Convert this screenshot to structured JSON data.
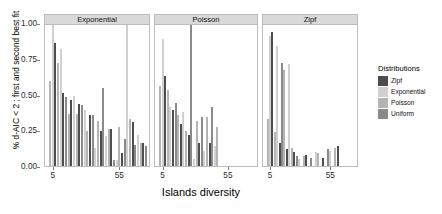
{
  "chart_data": {
    "type": "bar",
    "title": "",
    "xlabel": "Islands diversity",
    "ylabel": "% d-AIC < 2 ; first and second best fit",
    "ylim": [
      0,
      1
    ],
    "yticks": [
      "0.00",
      "0.25",
      "0.50",
      "0.75",
      "1.00"
    ],
    "ytickvals": [
      0,
      0.25,
      0.5,
      0.75,
      1
    ],
    "xticks": [
      "5",
      "55"
    ],
    "xtickvals": [
      5,
      55
    ],
    "grid": false,
    "legend_position": "right",
    "legend_title": "Distributions",
    "facet_variable": "best fit distribution",
    "facets": [
      "Exponential",
      "Poisson",
      "Zipf"
    ],
    "series": [
      {
        "name": "Zipf",
        "color": "#4d4d4d"
      },
      {
        "name": "Exponential",
        "color": "#d0d0d0"
      },
      {
        "name": "Poisson",
        "color": "#b4b4b4"
      },
      {
        "name": "Uniform",
        "color": "#8a8a8a"
      }
    ],
    "panels": [
      {
        "facet": "Exponential",
        "bars": [
          {
            "x": 3,
            "series": "Poisson",
            "value": 0.6
          },
          {
            "x": 5,
            "series": "Exponential",
            "value": 1.0
          },
          {
            "x": 7,
            "series": "Zipf",
            "value": 0.87
          },
          {
            "x": 9,
            "series": "Poisson",
            "value": 0.73
          },
          {
            "x": 11,
            "series": "Exponential",
            "value": 0.83
          },
          {
            "x": 13,
            "series": "Zipf",
            "value": 0.52
          },
          {
            "x": 15,
            "series": "Uniform",
            "value": 0.49
          },
          {
            "x": 17,
            "series": "Poisson",
            "value": 0.37
          },
          {
            "x": 19,
            "series": "Zipf",
            "value": 0.47
          },
          {
            "x": 21,
            "series": "Exponential",
            "value": 0.5
          },
          {
            "x": 23,
            "series": "Poisson",
            "value": 0.37
          },
          {
            "x": 25,
            "series": "Zipf",
            "value": 0.44
          },
          {
            "x": 27,
            "series": "Uniform",
            "value": 0.43
          },
          {
            "x": 29,
            "series": "Exponential",
            "value": 0.4
          },
          {
            "x": 31,
            "series": "Poisson",
            "value": 0.25
          },
          {
            "x": 33,
            "series": "Zipf",
            "value": 0.36
          },
          {
            "x": 35,
            "series": "Uniform",
            "value": 0.36
          },
          {
            "x": 37,
            "series": "Exponential",
            "value": 0.13
          },
          {
            "x": 39,
            "series": "Poisson",
            "value": 0.32
          },
          {
            "x": 41,
            "series": "Zipf",
            "value": 0.25
          },
          {
            "x": 43,
            "series": "Uniform",
            "value": 0.55
          },
          {
            "x": 45,
            "series": "Exponential",
            "value": 0.21
          },
          {
            "x": 47,
            "series": "Poisson",
            "value": 0.26
          },
          {
            "x": 49,
            "series": "Zipf",
            "value": 0.26
          },
          {
            "x": 51,
            "series": "Uniform",
            "value": 0.04
          },
          {
            "x": 53,
            "series": "Exponential",
            "value": 0.04
          },
          {
            "x": 55,
            "series": "Poisson",
            "value": 0.28
          },
          {
            "x": 57,
            "series": "Zipf",
            "value": 0.09
          },
          {
            "x": 59,
            "series": "Uniform",
            "value": 0.19
          },
          {
            "x": 61,
            "series": "Exponential",
            "value": 1.0
          },
          {
            "x": 63,
            "series": "Poisson",
            "value": 0.33
          },
          {
            "x": 65,
            "series": "Zipf",
            "value": 0.31
          },
          {
            "x": 67,
            "series": "Uniform",
            "value": 0.15
          },
          {
            "x": 69,
            "series": "Exponential",
            "value": 0.22
          },
          {
            "x": 71,
            "series": "Poisson",
            "value": 0.16
          },
          {
            "x": 73,
            "series": "Zipf",
            "value": 0.16
          },
          {
            "x": 75,
            "series": "Uniform",
            "value": 0.14
          }
        ]
      },
      {
        "facet": "Poisson",
        "bars": [
          {
            "x": 3,
            "series": "Poisson",
            "value": 0.57
          },
          {
            "x": 5,
            "series": "Exponential",
            "value": 0.9
          },
          {
            "x": 7,
            "series": "Zipf",
            "value": 0.64
          },
          {
            "x": 9,
            "series": "Poisson",
            "value": 0.54
          },
          {
            "x": 11,
            "series": "Exponential",
            "value": 0.42
          },
          {
            "x": 13,
            "series": "Zipf",
            "value": 0.4
          },
          {
            "x": 15,
            "series": "Uniform",
            "value": 0.45
          },
          {
            "x": 17,
            "series": "Poisson",
            "value": 0.36
          },
          {
            "x": 19,
            "series": "Zipf",
            "value": 0.3
          },
          {
            "x": 21,
            "series": "Exponential",
            "value": 0.38
          },
          {
            "x": 23,
            "series": "Poisson",
            "value": 0.25
          },
          {
            "x": 25,
            "series": "Zipf",
            "value": 0.22
          },
          {
            "x": 27,
            "series": "Uniform",
            "value": 1.0
          },
          {
            "x": 29,
            "series": "Exponential",
            "value": 0.05
          },
          {
            "x": 31,
            "series": "Poisson",
            "value": 0.32
          },
          {
            "x": 33,
            "series": "Zipf",
            "value": 0.16
          },
          {
            "x": 35,
            "series": "Uniform",
            "value": 0.35
          },
          {
            "x": 37,
            "series": "Exponential",
            "value": 0.11
          },
          {
            "x": 39,
            "series": "Poisson",
            "value": 0.35
          },
          {
            "x": 41,
            "series": "Zipf",
            "value": 0.16
          },
          {
            "x": 43,
            "series": "Uniform",
            "value": 0.42
          },
          {
            "x": 45,
            "series": "Exponential",
            "value": 0.14
          },
          {
            "x": 47,
            "series": "Poisson",
            "value": 0.28
          }
        ]
      },
      {
        "facet": "Zipf",
        "bars": [
          {
            "x": 3,
            "series": "Poisson",
            "value": 0.33
          },
          {
            "x": 5,
            "series": "Exponential",
            "value": 0.92
          },
          {
            "x": 7,
            "series": "Zipf",
            "value": 0.95
          },
          {
            "x": 9,
            "series": "Poisson",
            "value": 0.24
          },
          {
            "x": 11,
            "series": "Exponential",
            "value": 0.85
          },
          {
            "x": 13,
            "series": "Zipf",
            "value": 0.16
          },
          {
            "x": 15,
            "series": "Uniform",
            "value": 0.73
          },
          {
            "x": 17,
            "series": "Poisson",
            "value": 0.68
          },
          {
            "x": 19,
            "series": "Zipf",
            "value": 0.12
          },
          {
            "x": 21,
            "series": "Exponential",
            "value": 0.72
          },
          {
            "x": 23,
            "series": "Poisson",
            "value": 0.13
          },
          {
            "x": 25,
            "series": "Zipf",
            "value": 0.1
          },
          {
            "x": 27,
            "series": "Uniform",
            "value": 0.07
          },
          {
            "x": 29,
            "series": "Exponential",
            "value": 0.05
          },
          {
            "x": 33,
            "series": "Poisson",
            "value": 0.07
          },
          {
            "x": 35,
            "series": "Zipf",
            "value": 0.08
          },
          {
            "x": 39,
            "series": "Uniform",
            "value": 0.06
          },
          {
            "x": 43,
            "series": "Exponential",
            "value": 0.1
          },
          {
            "x": 45,
            "series": "Poisson",
            "value": 0.09
          },
          {
            "x": 49,
            "series": "Zipf",
            "value": 0.06
          },
          {
            "x": 53,
            "series": "Uniform",
            "value": 0.12
          },
          {
            "x": 55,
            "series": "Exponential",
            "value": 0.11
          },
          {
            "x": 59,
            "series": "Poisson",
            "value": 0.13
          },
          {
            "x": 61,
            "series": "Zipf",
            "value": 0.14
          }
        ]
      }
    ]
  }
}
